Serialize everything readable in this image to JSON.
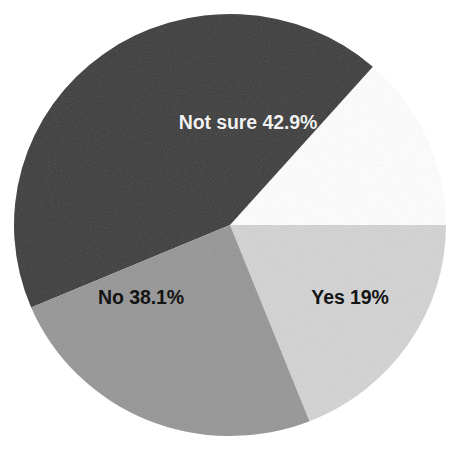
{
  "chart_data": {
    "type": "pie",
    "title": "",
    "subtitle": "",
    "xlabel": "",
    "ylabel": "",
    "legend_position": "none",
    "grid": false,
    "labels_inside_slices": true,
    "total_percent": 100,
    "categories": [
      "Not sure",
      "No",
      "Yes"
    ],
    "values": [
      42.9,
      38.1,
      19
    ],
    "unit": "%",
    "slices": [
      {
        "name": "Not sure",
        "value": 42.9,
        "label": "Not sure 42.9%",
        "color": "#3d3d3d",
        "text_color": "#f2f2f2",
        "start_angle_deg": 247.0,
        "end_angle_deg": 401.4
      },
      {
        "name": "Yes",
        "value": 19,
        "label": "Yes 19%",
        "color": "#d4d4d4",
        "text_color": "#141414",
        "start_angle_deg": 90.0,
        "end_angle_deg": 158.4
      },
      {
        "name": "No",
        "value": 38.1,
        "label": "No 38.1%",
        "color": "#969696",
        "text_color": "#141414",
        "start_angle_deg": 158.4,
        "end_angle_deg": 247.0
      }
    ]
  },
  "geometry": {
    "center_x": 230,
    "center_y": 225,
    "radius_x": 216,
    "radius_y": 211
  },
  "colors": {
    "background": "#ffffff",
    "not_sure": "#3d3d3d",
    "no": "#969696",
    "yes": "#d4d4d4",
    "label_light": "#f2f2f2",
    "label_dark": "#141414"
  }
}
